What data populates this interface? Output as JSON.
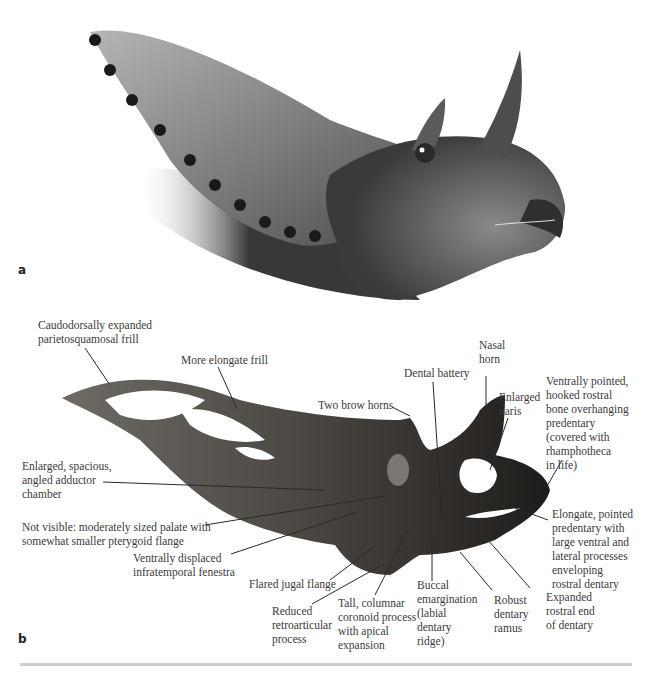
{
  "figure": {
    "panel_a": {
      "letter": "a",
      "illustration": "life restoration of horned dinosaur head (grayscale)"
    },
    "panel_b": {
      "letter": "b",
      "illustration": "fossil skull photograph, lateral view",
      "labels": [
        {
          "id": "frill",
          "text": "Caudodorsally expanded\nparietosquamosal frill"
        },
        {
          "id": "elongate-frill",
          "text": "More elongate frill"
        },
        {
          "id": "brow-horns",
          "text": "Two brow horns"
        },
        {
          "id": "dental-battery",
          "text": "Dental battery"
        },
        {
          "id": "nasal-horn",
          "text": "Nasal\nhorn"
        },
        {
          "id": "naris",
          "text": "Enlarged\nnaris"
        },
        {
          "id": "rostral",
          "text": "Ventrally pointed,\nhooked rostral\nbone overhanging\npredentary\n(covered with\nrhamphotheca\nin life)"
        },
        {
          "id": "adductor",
          "text": "Enlarged, spacious,\nangled adductor\nchamber"
        },
        {
          "id": "palate",
          "text": "Not visible: moderately sized palate with\nsomewhat smaller pterygoid flange"
        },
        {
          "id": "infratemporal",
          "text": "Ventrally displaced\ninfratemporal fenestra"
        },
        {
          "id": "jugal",
          "text": "Flared jugal flange"
        },
        {
          "id": "retroarticular",
          "text": "Reduced\nretroarticular\nprocess"
        },
        {
          "id": "coronoid",
          "text": "Tall, columnar\ncoronoid process\nwith apical\nexpansion"
        },
        {
          "id": "buccal",
          "text": "Buccal\nemargination\n(labial\ndentary\nridge)"
        },
        {
          "id": "dentary-ramus",
          "text": "Robust\ndentary\nramus"
        },
        {
          "id": "rostral-dentary",
          "text": "Expanded\nrostral end\nof dentary"
        },
        {
          "id": "predentary",
          "text": "Elongate, pointed\npredentary with\nlarge ventral and\nlateral processes\nenveloping\nrostral dentary"
        }
      ]
    },
    "colors": {
      "text": "#3a3a3a",
      "leader": "#2a2a2a",
      "divider": "#cfcfcf"
    }
  }
}
